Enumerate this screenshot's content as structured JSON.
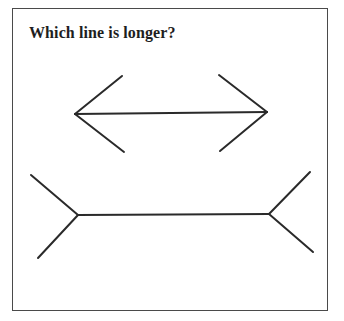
{
  "title": "Which line is longer?",
  "colors": {
    "background": "#ffffff",
    "frame": "#4a4a4a",
    "lines": "#2a2a2a",
    "text": "#1e1e1e"
  },
  "figures": {
    "top_arrow": {
      "shaft": {
        "x1": 75,
        "y1": 114,
        "x2": 267,
        "y2": 112
      },
      "left_fins": [
        {
          "x1": 75,
          "y1": 114,
          "x2": 122,
          "y2": 76
        },
        {
          "x1": 75,
          "y1": 114,
          "x2": 124,
          "y2": 152
        }
      ],
      "right_fins": [
        {
          "x1": 267,
          "y1": 112,
          "x2": 219,
          "y2": 75
        },
        {
          "x1": 267,
          "y1": 112,
          "x2": 220,
          "y2": 151
        }
      ]
    },
    "bottom_arrow": {
      "shaft": {
        "x1": 78,
        "y1": 215,
        "x2": 269,
        "y2": 214
      },
      "left_fins": [
        {
          "x1": 78,
          "y1": 215,
          "x2": 31,
          "y2": 175
        },
        {
          "x1": 78,
          "y1": 215,
          "x2": 38,
          "y2": 258
        }
      ],
      "right_fins": [
        {
          "x1": 269,
          "y1": 214,
          "x2": 310,
          "y2": 172
        },
        {
          "x1": 269,
          "y1": 214,
          "x2": 313,
          "y2": 252
        }
      ]
    }
  }
}
